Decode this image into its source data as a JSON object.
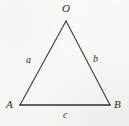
{
  "figure": {
    "kind": "triangle-diagram",
    "background_color": "#fbfbfa",
    "stroke_color": "#3a3a3a",
    "base_stroke_color": "#2f2f2f",
    "vertices": [
      {
        "id": "O",
        "label": "O",
        "x": 66,
        "y": 21
      },
      {
        "id": "A",
        "label": "A",
        "x": 20,
        "y": 105
      },
      {
        "id": "B",
        "label": "B",
        "x": 110,
        "y": 105
      }
    ],
    "sides": [
      {
        "id": "a",
        "label": "a",
        "from": "A",
        "to": "O",
        "label_x": 29,
        "label_y": 60
      },
      {
        "id": "b",
        "label": "b",
        "from": "O",
        "to": "B",
        "label_x": 96,
        "label_y": 59
      },
      {
        "id": "c",
        "label": "c",
        "from": "A",
        "to": "B",
        "label_x": 66,
        "label_y": 115
      }
    ]
  }
}
